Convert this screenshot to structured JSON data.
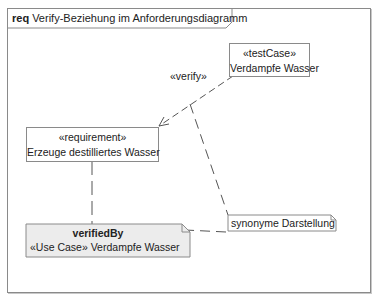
{
  "diagram": {
    "frame": {
      "kind": "req",
      "name": "Verify-Beziehung im Anforderungsdiagramm"
    },
    "elements": {
      "test_case": {
        "stereotype": "«testCase»",
        "name": "Verdampfe Wasser"
      },
      "requirement": {
        "stereotype": "«requirement»",
        "name": "Erzeuge destilliertes Wasser"
      },
      "synonym_note": {
        "text": "synonyme Darstellung"
      },
      "verified_by_note": {
        "heading": "verifiedBy",
        "text": "«Use Case» Verdampfe Wasser"
      }
    },
    "relations": [
      {
        "type": "verify",
        "label": "«verify»",
        "from": "test_case",
        "to": "requirement"
      }
    ],
    "colors": {
      "line": "#555555",
      "border": "#8a8a8a",
      "note_fill": "#ececec"
    }
  }
}
